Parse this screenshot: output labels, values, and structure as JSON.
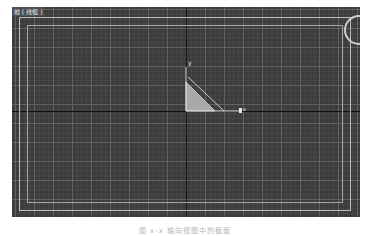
{
  "viewport": {
    "label": "前 [ 线框 ]",
    "background_color": "#3c3c3c",
    "grid_color": "#787878",
    "axis_labels": {
      "y": "y",
      "x": "x"
    },
    "icons": {
      "nav_cube": "viewcube-icon",
      "gizmo": "transform-gizmo-icon"
    }
  },
  "shape": {
    "type": "right-triangle",
    "fill": "#a9a9a9",
    "outline": "#d0d0d0"
  },
  "caption": "图 x-x  轴向视图中的截面"
}
